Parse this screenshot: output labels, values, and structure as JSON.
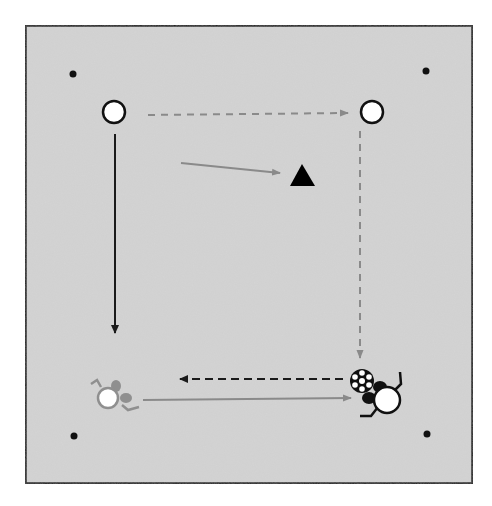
{
  "diagram": {
    "type": "soccer-drill",
    "field": {
      "x": 25,
      "y": 25,
      "width": 448,
      "height": 459,
      "fill": "#d3d3d3",
      "border": "#1a1a1a"
    },
    "cones": [
      {
        "id": "cone-top-left",
        "x": 73,
        "y": 74
      },
      {
        "id": "cone-top-right",
        "x": 426,
        "y": 71
      },
      {
        "id": "cone-bottom-left",
        "x": 74,
        "y": 436
      },
      {
        "id": "cone-bottom-right",
        "x": 427,
        "y": 434
      }
    ],
    "players_stationary": [
      {
        "id": "player-top-left",
        "x": 114,
        "y": 112
      },
      {
        "id": "player-top-right",
        "x": 372,
        "y": 112
      }
    ],
    "defender": {
      "id": "defender-triangle",
      "x": 302,
      "y": 177,
      "size": 24,
      "color": "#000000"
    },
    "ball": {
      "id": "soccer-ball",
      "x": 362,
      "y": 382
    },
    "active_player": {
      "id": "player-with-ball",
      "x": 387,
      "y": 398,
      "color": "#000000"
    },
    "ghost_player": {
      "id": "player-ghost",
      "x": 108,
      "y": 397,
      "color": "#909090"
    },
    "arrows": [
      {
        "id": "run-top-left-down",
        "style": "solid",
        "color": "#1a1a1a",
        "x1": 115,
        "y1": 134,
        "x2": 115,
        "y2": 333
      },
      {
        "id": "pass-top-across",
        "style": "dashed",
        "color": "#8a8a8a",
        "x1": 148,
        "y1": 115,
        "x2": 348,
        "y2": 113
      },
      {
        "id": "pass-right-down",
        "style": "dashed",
        "color": "#8a8a8a",
        "x1": 360,
        "y1": 131,
        "x2": 360,
        "y2": 358
      },
      {
        "id": "move-to-defender",
        "style": "solid",
        "color": "#8a8a8a",
        "x1": 181,
        "y1": 163,
        "x2": 280,
        "y2": 173
      },
      {
        "id": "pass-bottom-left",
        "style": "dashed",
        "color": "#1a1a1a",
        "x1": 343,
        "y1": 379,
        "x2": 178,
        "y2": 379
      },
      {
        "id": "run-bottom-right",
        "style": "solid",
        "color": "#8a8a8a",
        "x1": 143,
        "y1": 400,
        "x2": 351,
        "y2": 398
      }
    ]
  }
}
